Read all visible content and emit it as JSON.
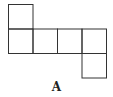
{
  "diagram": {
    "type": "cube-net",
    "label": "A",
    "stroke_color": "#333333",
    "cell_size": 24.5,
    "origin": [
      8,
      4
    ],
    "cells": [
      {
        "row": 0,
        "col": 0
      },
      {
        "row": 1,
        "col": 0
      },
      {
        "row": 1,
        "col": 1
      },
      {
        "row": 1,
        "col": 2
      },
      {
        "row": 1,
        "col": 3
      },
      {
        "row": 2,
        "col": 3
      }
    ]
  }
}
